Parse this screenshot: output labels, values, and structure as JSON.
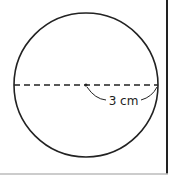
{
  "figure": {
    "shape": "circle",
    "diameter_style": "dashed",
    "radius_label": "3 cm",
    "stroke_color": "#222222",
    "background": "#ffffff"
  }
}
